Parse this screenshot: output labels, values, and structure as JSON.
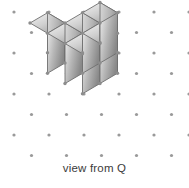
{
  "figure": {
    "caption": "view from Q",
    "width": 189,
    "height": 188,
    "background_color": "#ffffff"
  },
  "dot_grid": {
    "name": "isometric-dot-lattice",
    "dot_color": "#9a9a9a",
    "dot_radius": 1.6,
    "columns_spacing_x": 35,
    "rows_spacing_y": 20.5,
    "origin_x": 14,
    "origin_y": 12,
    "cols": 6,
    "rows": 9,
    "stagger_x": 17.5
  },
  "solid": {
    "name": "isometric-cube-stack",
    "cube_count": 6,
    "cube_half_width": 17.5,
    "cube_half_depth": 10.25,
    "cube_height": 40,
    "origin_x": 30,
    "origin_y": 63,
    "colors": {
      "top_light": "#f2f2f2",
      "top_dark": "#a8a8a8",
      "left_light": "#d2d2d2",
      "left_dark": "#8f8f8f",
      "right_light": "#eaeaea",
      "right_dark": "#8a8a8a",
      "edge": "#6e6e6e",
      "vertex": "#8d8d8d"
    },
    "edge_width": 0.9,
    "vertex_radius": 1.7,
    "cubes": [
      {
        "label": "back-left-top-cube",
        "i": 0,
        "j": 0,
        "k": 0
      },
      {
        "label": "back-middle-cube",
        "i": 1,
        "j": 0,
        "k": 0
      },
      {
        "label": "back-right-cube",
        "i": 2,
        "j": 0,
        "k": 0
      },
      {
        "label": "front-middle-cube",
        "i": 1,
        "j": 1,
        "k": 0
      },
      {
        "label": "front-right-cube",
        "i": 2,
        "j": 1,
        "k": 0
      },
      {
        "label": "front-low-cube",
        "i": 1,
        "j": 2,
        "k": 0
      }
    ]
  }
}
